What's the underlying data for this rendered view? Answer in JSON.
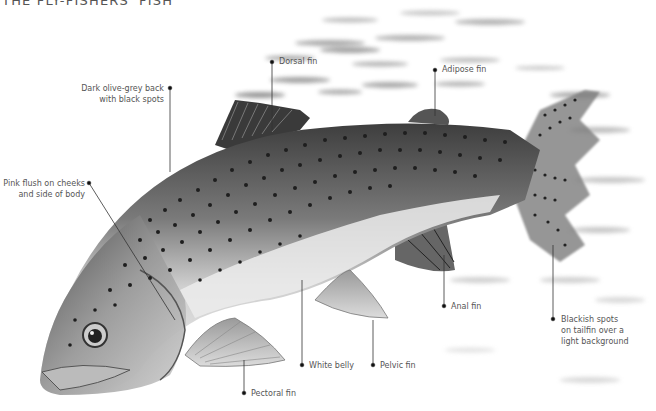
{
  "title": "THE FLY-FISHERS' FISH",
  "colors": {
    "background": "#ffffff",
    "label_text": "#555555",
    "leader_line": "#333333",
    "fish_dark": "#3a3a3a",
    "fish_mid": "#8a8a8a",
    "fish_light": "#d8d8d8",
    "spots": "#1e1e1e"
  },
  "labels": [
    {
      "id": "dorsal-fin",
      "text": "Dorsal fin"
    },
    {
      "id": "adipose-fin",
      "text": "Adipose fin"
    },
    {
      "id": "back",
      "line1": "Dark olive-grey back",
      "line2": "with black spots"
    },
    {
      "id": "pink-flush",
      "line1": "Pink flush on cheeks",
      "line2": "and side of body"
    },
    {
      "id": "anal-fin",
      "text": "Anal fin"
    },
    {
      "id": "tailfin-spots",
      "line1": "Blackish spots",
      "line2": "on tailfin over a",
      "line3": "light background"
    },
    {
      "id": "white-belly",
      "text": "White belly"
    },
    {
      "id": "pelvic-fin",
      "text": "Pelvic fin"
    },
    {
      "id": "pectoral-fin",
      "text": "Pectoral fin"
    }
  ]
}
